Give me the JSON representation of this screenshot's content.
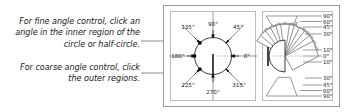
{
  "annotations": {
    "fine": "For fine angle control, click an angle in the inner region of the circle or half-circle.",
    "coarse": "For coarse angle control, click the outer regions."
  },
  "circle_widget": {
    "name": "angle-dial-full-circle",
    "degree_symbol": "°",
    "labels": [
      {
        "text": "90°",
        "angle": 90
      },
      {
        "text": "135°",
        "angle": 135
      },
      {
        "text": "45°",
        "angle": 45
      },
      {
        "text": "180°",
        "angle": 180
      },
      {
        "text": "0°",
        "angle": 0
      },
      {
        "text": "225°",
        "angle": 225
      },
      {
        "text": "315°",
        "angle": 315
      },
      {
        "text": "270°",
        "angle": 270
      }
    ],
    "needle_angle": 270,
    "marker_dots": [
      135,
      180,
      225
    ],
    "reference_angle": 0
  },
  "halfcircle_widget": {
    "name": "angle-dial-half-circle",
    "labels": [
      "90°",
      "60°",
      "45°",
      "30°",
      "10°",
      "0°",
      "10°",
      "30°",
      "45°",
      "60°",
      "90°"
    ],
    "needle_angle": 90,
    "reference_angle": 0
  },
  "colors": {
    "ink": "#1a1a1a",
    "line": "#6e6e6e",
    "frame": "#9a9a9a",
    "background": "#ffffff"
  }
}
